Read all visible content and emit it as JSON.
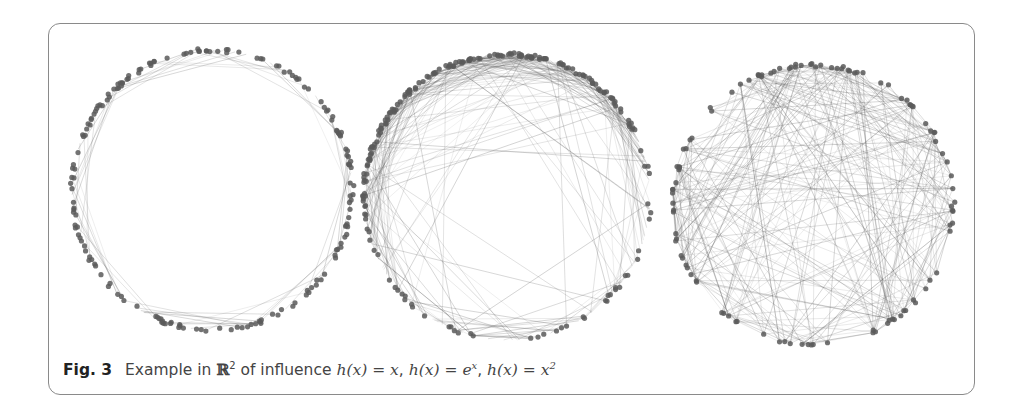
{
  "figure": {
    "label": "Fig. 3",
    "caption_prefix": "Example in",
    "space": "ℝ",
    "space_exp": "2",
    "caption_mid": "of influence",
    "formulas": [
      {
        "lhs": "h(x) = ",
        "rhs": "x",
        "sup": ""
      },
      {
        "lhs": "h(x) = ",
        "rhs": "e",
        "sup": "x"
      },
      {
        "lhs": "h(x) = ",
        "rhs": "x",
        "sup": "2"
      }
    ]
  },
  "panels": [
    {
      "name": "influence-linear",
      "influence": "h(x) = x",
      "cx": 212,
      "cy": 190,
      "r": 140,
      "nodes": 180,
      "edges": 60,
      "edge_style": "perimeter",
      "seed": 11
    },
    {
      "name": "influence-exponential",
      "influence": "h(x) = e^x",
      "cx": 507,
      "cy": 197,
      "r": 143,
      "nodes": 200,
      "edges": 260,
      "edge_style": "mixed",
      "seed": 23
    },
    {
      "name": "influence-quadratic",
      "influence": "h(x) = x^2",
      "cx": 813,
      "cy": 205,
      "r": 140,
      "nodes": 110,
      "edges": 300,
      "edge_style": "chords",
      "seed": 37
    }
  ],
  "colors": {
    "node": "#5a5a5a",
    "edge": "#555555",
    "frame": "#8a8a8a",
    "caption": "#444444"
  }
}
